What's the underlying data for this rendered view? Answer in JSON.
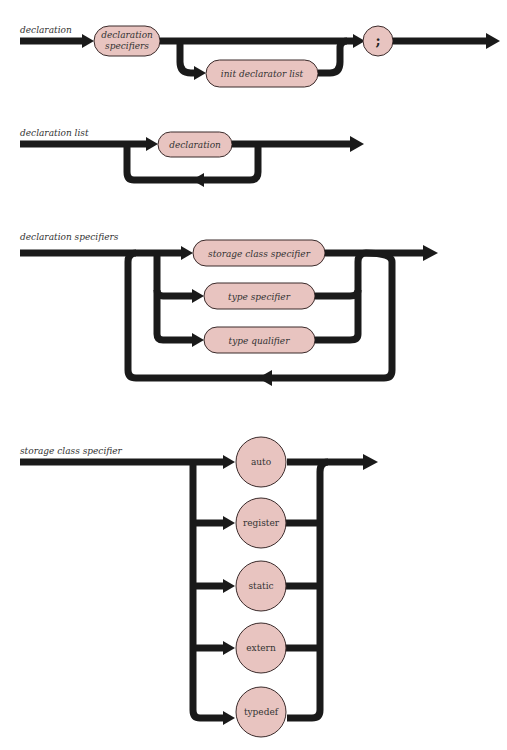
{
  "diagrams": [
    {
      "title": "declaration",
      "nodes": {
        "decl_specifiers_line1": "declaration",
        "decl_specifiers_line2": "specifiers",
        "init_declarator_list": "init declarator list",
        "terminator": ";"
      }
    },
    {
      "title": "declaration list",
      "nodes": {
        "declaration": "declaration"
      }
    },
    {
      "title": "declaration specifiers",
      "nodes": {
        "storage_class_specifier": "storage class specifier",
        "type_specifier": "type specifier",
        "type_qualifier": "type qualifier"
      }
    },
    {
      "title": "storage class specifier",
      "nodes": {
        "auto": "auto",
        "register": "register",
        "static": "static",
        "extern": "extern",
        "typedef": "typedef"
      }
    }
  ],
  "colors": {
    "node_fill": "#e8c4c0",
    "track": "#1a1a1a"
  }
}
